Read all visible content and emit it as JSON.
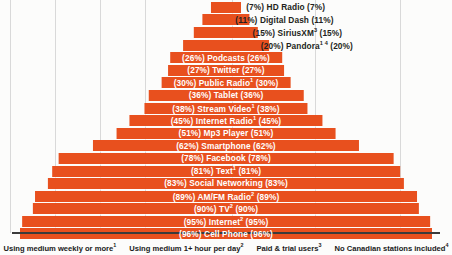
{
  "chart_data": {
    "type": "bar",
    "orientation": "horizontal-pyramid",
    "title": "",
    "xlabel": "",
    "ylabel": "",
    "xlim": [
      0,
      100
    ],
    "grid": true,
    "value_unit": "%",
    "label_format": "(value%) Category (value%)",
    "categories": [
      "HD Radio",
      "Digital Dash",
      "SiriusXM",
      "Pandora",
      "Podcasts",
      "Twitter",
      "Public Radio",
      "Tablet",
      "Stream Video",
      "Internet Radio",
      "Mp3 Player",
      "Smartphone",
      "Facebook",
      "Text",
      "Social Networking",
      "AM/FM Radio",
      "TV",
      "Internet",
      "Cell Phone"
    ],
    "values": [
      7,
      11,
      15,
      20,
      26,
      27,
      30,
      36,
      38,
      45,
      51,
      62,
      78,
      81,
      83,
      89,
      90,
      95,
      96
    ],
    "rows": [
      {
        "label": "HD Radio",
        "sup": "",
        "value": 7,
        "text": "(7%) HD Radio (7%)",
        "label_color": "dark"
      },
      {
        "label": "Digital Dash",
        "sup": "",
        "value": 11,
        "text": "(11%) Digital Dash (11%)",
        "label_color": "dark"
      },
      {
        "label": "SiriusXM",
        "sup": "3",
        "value": 15,
        "text": "(15%) SiriusXM",
        "text_tail": " (15%)",
        "label_color": "dark"
      },
      {
        "label": "Pandora",
        "sup": "1 4",
        "value": 20,
        "text": "(20%) Pandora",
        "text_tail": " (20%)",
        "label_color": "dark"
      },
      {
        "label": "Podcasts",
        "sup": "",
        "value": 26,
        "text": "(26%) Podcasts (26%)",
        "label_color": "white"
      },
      {
        "label": "Twitter",
        "sup": "",
        "value": 27,
        "text": "(27%) Twitter (27%)",
        "label_color": "white"
      },
      {
        "label": "Public Radio",
        "sup": "1",
        "value": 30,
        "text": "(30%) Public Radio",
        "text_tail": " (30%)",
        "label_color": "white"
      },
      {
        "label": "Tablet",
        "sup": "",
        "value": 36,
        "text": "(36%) Tablet (36%)",
        "label_color": "white"
      },
      {
        "label": "Stream Video",
        "sup": "1",
        "value": 38,
        "text": "(38%) Stream Video",
        "text_tail": " (38%)",
        "label_color": "white"
      },
      {
        "label": "Internet Radio",
        "sup": "1",
        "value": 45,
        "text": "(45%) Internet Radio",
        "text_tail": " (45%)",
        "label_color": "white"
      },
      {
        "label": "Mp3 Player",
        "sup": "",
        "value": 51,
        "text": "(51%) Mp3 Player (51%)",
        "label_color": "white"
      },
      {
        "label": "Smartphone",
        "sup": "",
        "value": 62,
        "text": "(62%) Smartphone (62%)",
        "label_color": "white"
      },
      {
        "label": "Facebook",
        "sup": "",
        "value": 78,
        "text": "(78%) Facebook (78%)",
        "label_color": "white"
      },
      {
        "label": "Text",
        "sup": "1",
        "value": 81,
        "text": "(81%) Text",
        "text_tail": " (81%)",
        "label_color": "white"
      },
      {
        "label": "Social Networking",
        "sup": "",
        "value": 83,
        "text": "(83%) Social Networking (83%)",
        "label_color": "white"
      },
      {
        "label": "AM/FM Radio",
        "sup": "2",
        "value": 89,
        "text": "(89%) AM/FM Radio",
        "text_tail": " (89%)",
        "label_color": "white"
      },
      {
        "label": "TV",
        "sup": "2",
        "value": 90,
        "text": "(90%) TV",
        "text_tail": " (90%)",
        "label_color": "white"
      },
      {
        "label": "Internet",
        "sup": "2",
        "value": 95,
        "text": "(95%) Internet",
        "text_tail": " (95%)",
        "label_color": "white"
      },
      {
        "label": "Cell Phone",
        "sup": "",
        "value": 96,
        "text": "(96%) Cell Phone (96%)",
        "label_color": "white"
      }
    ],
    "bar_color": "#e8501e",
    "gridline_color": "#d9d9d9",
    "legend_position": "bottom"
  },
  "legend": {
    "items": [
      {
        "text": "Using medium weekly or more",
        "sup": "1"
      },
      {
        "text": "Using medium 1+ hour per day",
        "sup": "2"
      },
      {
        "text": "Paid & trial users",
        "sup": "3"
      },
      {
        "text": "No Canadian stations included",
        "sup": "4"
      }
    ]
  }
}
